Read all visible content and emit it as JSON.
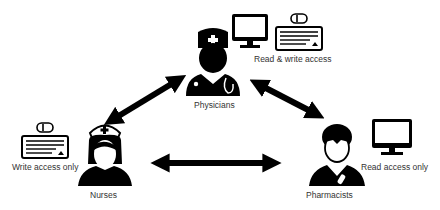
{
  "diagram": {
    "roles": [
      {
        "id": "physicians",
        "label": "Physicians",
        "access": "Read & write access",
        "devices": [
          "monitor",
          "keyboard-mouse"
        ]
      },
      {
        "id": "nurses",
        "label": "Nurses",
        "access": "Write access only",
        "devices": [
          "keyboard-mouse"
        ]
      },
      {
        "id": "pharmacists",
        "label": "Pharmacists",
        "access": "Read access only",
        "devices": [
          "monitor"
        ]
      }
    ],
    "connections": [
      {
        "from": "physicians",
        "to": "nurses",
        "type": "bidirectional"
      },
      {
        "from": "physicians",
        "to": "pharmacists",
        "type": "bidirectional"
      },
      {
        "from": "nurses",
        "to": "pharmacists",
        "type": "bidirectional"
      }
    ],
    "colors": {
      "icon": "#000000",
      "text": "#333333",
      "background": "#ffffff"
    }
  }
}
